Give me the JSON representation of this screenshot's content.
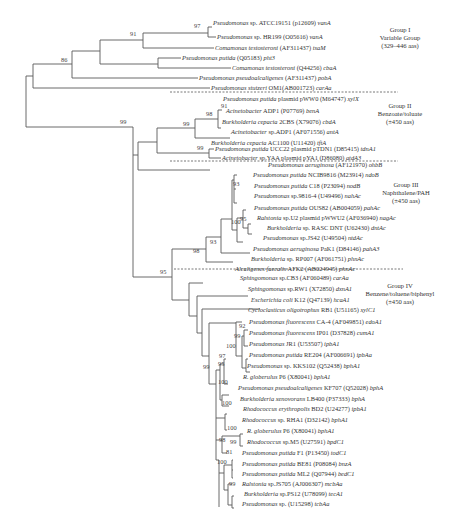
{
  "figure": {
    "type": "phylogenetic-tree",
    "groups": [
      {
        "id": "g1",
        "lines": [
          "Group I",
          "Variable Group",
          "(329–446 aas)"
        ]
      },
      {
        "id": "g2",
        "lines": [
          "Group II",
          "Benzoate/toluate",
          "(±450 aas)"
        ]
      },
      {
        "id": "g3",
        "lines": [
          "Group III",
          "Naphthalene/PAH",
          "(±450 aas)"
        ]
      },
      {
        "id": "g4",
        "lines": [
          "Group IV",
          "Benzene/toluene/biphenyl",
          "(±450 aas)"
        ]
      }
    ],
    "leaves": [
      {
        "species": "Pseudomonas",
        "rest": " sp. ATCC19151 (p12609) ",
        "gene": "vanA"
      },
      {
        "species": "Pseudomonas",
        "rest": " sp. HR199 (O05616) ",
        "gene": "vanA"
      },
      {
        "species": "Comamonas testosteroni",
        "rest": " (AF311437) ",
        "gene": "tsaM"
      },
      {
        "species": "Pseudomonas putida",
        "rest": " (Q05183) ",
        "gene": "pht3"
      },
      {
        "species": "Comamonas testosteroni",
        "rest": " (Q44256) ",
        "gene": "cbaA"
      },
      {
        "species": "Pseudomonas pseudoalcaligenes",
        "rest": " (AF311437) ",
        "gene": "pobA"
      },
      {
        "species": "Pseudomonas stutzeri",
        "rest": " OM1(AB001723) ",
        "gene": "carAa"
      },
      {
        "species": "Pseudomonas putida",
        "rest": " plasmid pWW0 (M64747) ",
        "gene": "xylX"
      },
      {
        "species": "Acinetobacter",
        "rest": " ADP1 (P07769) ",
        "gene": "benA"
      },
      {
        "species": "Burkholderia cepacia",
        "rest": " 2CBS (X79076) ",
        "gene": "cbdA"
      },
      {
        "species": "Acinetobacter",
        "rest": " sp.ADP1 (AF071556) ",
        "gene": "antA"
      },
      {
        "species": "Burkholderia cepacia",
        "rest": " AC1100 (U11420) ",
        "gene": "tftA"
      },
      {
        "species": "Pseudomonas putida",
        "rest": " UCC22 plasmid pTDN1 (D85415) ",
        "gene": "tdnA1"
      },
      {
        "species": "Acinetobacter",
        "rest": " sp.YAA plasmid pYA1 (D86080) ",
        "gene": "atdA3"
      },
      {
        "species": "Pseudomonas aeruginosa",
        "rest": " (AF121970) ",
        "gene": "ohbB"
      },
      {
        "species": "Pseudomonas putida",
        "rest": " NCIB9816 (M23914) ",
        "gene": "ndoB"
      },
      {
        "species": "Pseudomonas putida",
        "rest": " C18 (P23094) ",
        "gene": "nodB"
      },
      {
        "species": "Pseudomonas",
        "rest": " sp.9816-4 (U49496) ",
        "gene": "nahAc"
      },
      {
        "species": "Pseudomonas putida",
        "rest": " OUS82 (AB004059) ",
        "gene": "pahAc"
      },
      {
        "species": "Ralstonia",
        "rest": " sp.U2 plasmid pWWU2 (AF036940) ",
        "gene": "nagAc"
      },
      {
        "species": "Burkholderia",
        "rest": " sp. RASC DNT (U62430) ",
        "gene": "dntAc"
      },
      {
        "species": "Pseudomonas",
        "rest": " sp.JS42 (U49504) ",
        "gene": "ntdAc"
      },
      {
        "species": "Pseudomonas aeruginosa",
        "rest": " PaK1 (D84146) ",
        "gene": "pahA3"
      },
      {
        "species": "Burkholderia",
        "rest": " sp. RP007 (AF061751) ",
        "gene": "phnAc"
      },
      {
        "species": "Alcaligenes faecalis",
        "rest": " AFK2 (AB024945) ",
        "gene": "phnAc"
      },
      {
        "species": "Sphingomonas",
        "rest": " sp.CB3 (AF060489) ",
        "gene": "carAa"
      },
      {
        "species": "Sphingomonas",
        "rest": " sp.RW1 (X72850) ",
        "gene": "dxnA1"
      },
      {
        "species": "Escherichia coli",
        "rest": " K12 (Q47139) ",
        "gene": "hcaA1"
      },
      {
        "species": "Cycloclasticus oligotrophus",
        "rest": " RB1 (U51165) ",
        "gene": "xylC1"
      },
      {
        "species": "Pseudomonas fluorescens",
        "rest": " CA-4 (AF049851) ",
        "gene": "edoA1"
      },
      {
        "species": "Pseudomonas fluorescens",
        "rest": " IP01 (D37828) ",
        "gene": "cumA1"
      },
      {
        "species": "Pseudomonas",
        "rest": " JR1 (U53507) ",
        "gene": "ipbA1"
      },
      {
        "species": "Pseudomonas putida",
        "rest": " RE204 (AF006691) ",
        "gene": "ipbAa"
      },
      {
        "species": "Pseudomonas",
        "rest": " sp. KKS102 (Q52438) ",
        "gene": "bphA1"
      },
      {
        "species": "R. globerulus",
        "rest": " P6 (X80041) ",
        "gene": "bphA1"
      },
      {
        "species": "Pseudomonas pseudoalcaligenes",
        "rest": " KF707 (Q52028) ",
        "gene": "bphA"
      },
      {
        "species": "Burkholderia xenovorans",
        "rest": " LB400 (P37333) ",
        "gene": "bphA"
      },
      {
        "species": "Rhodococcus erythropolis",
        "rest": " BD2 (U24277) ",
        "gene": "ipbA1"
      },
      {
        "species": "Rhodococcus",
        "rest": " sp. RHA1 (D32142) ",
        "gene": "bphA1"
      },
      {
        "species": "R. globerulus",
        "rest": " P6 (X80041) ",
        "gene": "bphA1"
      },
      {
        "species": "Rhodococcus",
        "rest": " sp.M5 (U27591) ",
        "gene": "bpdC1"
      },
      {
        "species": "Pseudomonas putida",
        "rest": " F1 (P13450) ",
        "gene": "todC1"
      },
      {
        "species": "Pseudomonas putida",
        "rest": " BE81 (P08084) ",
        "gene": "bnzA"
      },
      {
        "species": "Pseudomonas putida",
        "rest": " ML2 (Q07944) ",
        "gene": "bedC1"
      },
      {
        "species": "Ralstonia",
        "rest": " sp.JS705 (AJ006307) ",
        "gene": "mcbAa"
      },
      {
        "species": "Burkholderia",
        "rest": " sp.PS12 (U78099) ",
        "gene": "tecA1"
      },
      {
        "species": "Pseudomonas",
        "rest": " sp. (U15298) ",
        "gene": "tcbAa"
      }
    ],
    "bootstrap": {
      "b86": "86",
      "b91a": "91",
      "b97": "97",
      "b99root": "99",
      "b99g2": "99",
      "b98g2": "98",
      "b91g2": "91",
      "b99tdn": "99",
      "b95": "95",
      "b98g3": "98",
      "b93g3": "93",
      "b93n": "93",
      "b100n": "100",
      "b95n": "95",
      "b92": "92",
      "b99f": "99",
      "b100f": "100",
      "b97f": "97",
      "b99g4": "99",
      "b95f": "95",
      "b100b": "100",
      "b100r": "100",
      "b100r2": "100",
      "b98t": "98",
      "b99t": "99",
      "b81": "81",
      "b100t": "100",
      "b99p": "99"
    }
  }
}
